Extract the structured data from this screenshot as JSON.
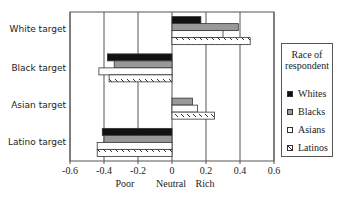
{
  "chart_data": {
    "type": "bar",
    "orientation": "horizontal",
    "title": "",
    "categories": [
      "White target",
      "Black target",
      "Asian target",
      "Latino target"
    ],
    "series": [
      {
        "name": "Whites",
        "color": "#111111",
        "pattern": "solid-black",
        "values": [
          0.17,
          -0.38,
          0.0,
          -0.41
        ]
      },
      {
        "name": "Blacks",
        "color": "#999999",
        "pattern": "solid-gray",
        "values": [
          0.39,
          -0.34,
          0.12,
          -0.4
        ]
      },
      {
        "name": "Asians",
        "color": "#ffffff",
        "pattern": "white",
        "values": [
          0.3,
          -0.43,
          0.15,
          -0.44
        ]
      },
      {
        "name": "Latinos",
        "color": "#ffffff",
        "pattern": "diagonal-hatch",
        "values": [
          0.46,
          -0.37,
          0.25,
          -0.44
        ]
      }
    ],
    "xlabel": "",
    "x_ticks": [
      "-0.6",
      "-0.4",
      "-0.2",
      "0",
      "0.2",
      "0.4",
      "0.6"
    ],
    "x_tick_values": [
      -0.6,
      -0.4,
      -0.2,
      0,
      0.2,
      0.4,
      0.6
    ],
    "x_axis_annotations": [
      "Poor",
      "Neutral",
      "Rich"
    ],
    "xlim": [
      -0.6,
      0.6
    ],
    "grid": "vertical gridlines at 0.2 intervals",
    "legend": {
      "title": "Race of respondent",
      "position": "right",
      "entries": [
        "Whites",
        "Blacks",
        "Asians",
        "Latinos"
      ]
    }
  },
  "legend": {
    "title_line1": "Race of",
    "title_line2": "respondent",
    "items": [
      "Whites",
      "Blacks",
      "Asians",
      "Latinos"
    ]
  },
  "axis": {
    "ticks": [
      "-0.6",
      "-0.4",
      "-0.2",
      "0",
      "0.2",
      "0.4",
      "0.6"
    ],
    "poor": "Poor",
    "neutral": "Neutral",
    "rich": "Rich"
  },
  "categories": [
    "White target",
    "Black target",
    "Asian target",
    "Latino target"
  ]
}
